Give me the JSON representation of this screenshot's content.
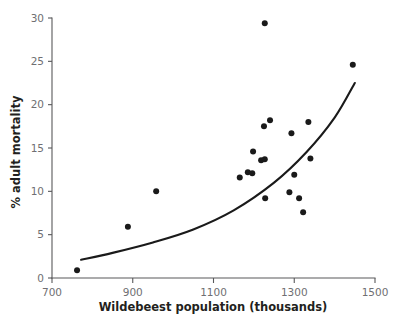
{
  "chart_data": {
    "type": "scatter",
    "title": "",
    "xlabel": "Wildebeest population (thousands)",
    "ylabel": "% adult mortality",
    "xlim": [
      700,
      1500
    ],
    "ylim": [
      0,
      30
    ],
    "xticks": [
      700,
      900,
      1100,
      1300,
      1500
    ],
    "yticks": [
      0,
      5,
      10,
      15,
      20,
      25,
      30
    ],
    "xtick_labels": [
      "700",
      "900",
      "1100",
      "1300",
      "1500"
    ],
    "ytick_labels": [
      "0",
      "5",
      "10",
      "15",
      "20",
      "25",
      "30"
    ],
    "grid": false,
    "legend": false,
    "legend_position": "none",
    "point_color": "#1a1a1a",
    "point_radius": 3.0,
    "axis_color": "#58585a",
    "tick_label_color": "#6f6f72",
    "axis_title_color": "#231f20",
    "x": [
      762,
      888,
      958,
      1165,
      1190,
      1200,
      1205,
      1222,
      1225,
      1227,
      1235,
      1240,
      1248,
      1255,
      1290,
      1300,
      1300,
      1305,
      1318,
      1330,
      1335,
      1340,
      1348,
      1445
    ],
    "y": [
      0.9,
      5.9,
      10.0,
      11.6,
      12.2,
      12.1,
      14.6,
      13.6,
      13.6,
      29.4,
      13.7,
      17.5,
      18.2,
      9.2,
      16.7,
      11.9,
      9.9,
      29.4,
      9.2,
      7.6,
      18.0,
      13.8,
      24.6,
      24.6
    ],
    "points": [
      {
        "x": 762,
        "y": 0.9
      },
      {
        "x": 888,
        "y": 5.9
      },
      {
        "x": 958,
        "y": 10.0
      },
      {
        "x": 1165,
        "y": 11.6
      },
      {
        "x": 1185,
        "y": 12.2
      },
      {
        "x": 1196,
        "y": 12.1
      },
      {
        "x": 1198,
        "y": 14.6
      },
      {
        "x": 1218,
        "y": 13.6
      },
      {
        "x": 1227,
        "y": 13.7
      },
      {
        "x": 1227,
        "y": 29.4
      },
      {
        "x": 1225,
        "y": 17.5
      },
      {
        "x": 1240,
        "y": 18.2
      },
      {
        "x": 1228,
        "y": 9.2
      },
      {
        "x": 1293,
        "y": 16.7
      },
      {
        "x": 1300,
        "y": 11.9
      },
      {
        "x": 1288,
        "y": 9.9
      },
      {
        "x": 1312,
        "y": 9.2
      },
      {
        "x": 1322,
        "y": 7.6
      },
      {
        "x": 1335,
        "y": 18.0
      },
      {
        "x": 1340,
        "y": 13.8
      },
      {
        "x": 1445,
        "y": 24.6
      }
    ],
    "trend": {
      "label": "exponential fit",
      "x_start": 772,
      "x_end": 1450,
      "y_start": 2.1,
      "y_end": 22.5,
      "curve_points": [
        {
          "x": 772,
          "y": 2.1
        },
        {
          "x": 850,
          "y": 2.9
        },
        {
          "x": 950,
          "y": 4.1
        },
        {
          "x": 1050,
          "y": 5.6
        },
        {
          "x": 1150,
          "y": 7.8
        },
        {
          "x": 1250,
          "y": 11.0
        },
        {
          "x": 1330,
          "y": 14.5
        },
        {
          "x": 1400,
          "y": 18.5
        },
        {
          "x": 1450,
          "y": 22.5
        }
      ]
    }
  },
  "figure": {
    "background": "#ffffff",
    "width": 396,
    "height": 330
  }
}
